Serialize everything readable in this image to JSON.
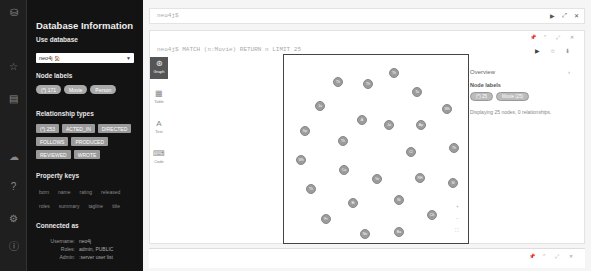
{
  "rail": {
    "icons": [
      {
        "name": "database-icon",
        "glyph": "⛁",
        "top": 6
      },
      {
        "name": "favorites-icon",
        "glyph": "☆",
        "top": 60
      },
      {
        "name": "documents-icon",
        "glyph": "▤",
        "top": 92
      },
      {
        "name": "cloud-icon",
        "glyph": "☁",
        "top": 150
      },
      {
        "name": "help-icon",
        "glyph": "?",
        "top": 180
      },
      {
        "name": "settings-icon",
        "glyph": "⚙",
        "top": 212
      },
      {
        "name": "about-icon",
        "glyph": "ⓘ",
        "top": 240
      }
    ]
  },
  "drawer": {
    "title": "Database Information",
    "use_database": {
      "label": "Use database",
      "value": "neo4j",
      "value_icon": "🏠"
    },
    "node_labels": {
      "label": "Node labels",
      "items": [
        "(*) 171",
        "Movie",
        "Person"
      ]
    },
    "relationship_types": {
      "label": "Relationship types",
      "items": [
        "(*) 253",
        "ACTED_IN",
        "DIRECTED",
        "FOLLOWS",
        "PRODUCED",
        "REVIEWED",
        "WROTE"
      ]
    },
    "property_keys": {
      "label": "Property keys",
      "items": [
        "born",
        "name",
        "rating",
        "released",
        "roles",
        "summary",
        "tagline",
        "title"
      ]
    },
    "connected_as": {
      "label": "Connected as",
      "rows": [
        {
          "key": "Username:",
          "value": "neo4j"
        },
        {
          "key": "Roles:",
          "value": "admin, PUBLIC"
        },
        {
          "key": "Admin:",
          "value": ":server user list"
        }
      ]
    }
  },
  "topbar": {
    "prompt": "neo4j$",
    "controls": [
      "▶",
      "⤢",
      "✕"
    ]
  },
  "frame": {
    "editor_query": "neo4j$ MATCH (n:Movie) RETURN n LIMIT 25",
    "frame_controls": [
      "📌",
      "⌃",
      "⤢",
      "✕"
    ],
    "editor_controls": [
      "▶",
      "☆",
      "⬇"
    ],
    "view_tabs": [
      {
        "name": "graph",
        "glyph": "⊛",
        "label": "Graph",
        "active": true
      },
      {
        "name": "table",
        "glyph": "▦",
        "label": "Table",
        "active": false
      },
      {
        "name": "text",
        "glyph": "A",
        "label": "Text",
        "active": false
      },
      {
        "name": "code",
        "glyph": "⌨",
        "label": "Code",
        "active": false
      }
    ],
    "graph": {
      "node_count": 25,
      "nodes": [
        {
          "x": 393,
          "y": 72,
          "label": "Th"
        },
        {
          "x": 337,
          "y": 81,
          "label": "Th"
        },
        {
          "x": 367,
          "y": 83,
          "label": "Th"
        },
        {
          "x": 416,
          "y": 91,
          "label": "To"
        },
        {
          "x": 319,
          "y": 105,
          "label": "Ju"
        },
        {
          "x": 446,
          "y": 108,
          "label": "Wh"
        },
        {
          "x": 361,
          "y": 119,
          "label": "A"
        },
        {
          "x": 388,
          "y": 124,
          "label": "Jo"
        },
        {
          "x": 420,
          "y": 124,
          "label": "Ap"
        },
        {
          "x": 304,
          "y": 130,
          "label": "Sp"
        },
        {
          "x": 342,
          "y": 140,
          "label": "Th"
        },
        {
          "x": 410,
          "y": 151,
          "label": "Cl"
        },
        {
          "x": 453,
          "y": 147,
          "label": "Th"
        },
        {
          "x": 300,
          "y": 159,
          "label": "Wh"
        },
        {
          "x": 343,
          "y": 169,
          "label": "Ca"
        },
        {
          "x": 376,
          "y": 178,
          "label": "Yo"
        },
        {
          "x": 419,
          "y": 177,
          "label": "RH"
        },
        {
          "x": 452,
          "y": 182,
          "label": "Sl"
        },
        {
          "x": 310,
          "y": 188,
          "label": "Th"
        },
        {
          "x": 352,
          "y": 202,
          "label": "Bi"
        },
        {
          "x": 398,
          "y": 199,
          "label": "Ni"
        },
        {
          "x": 431,
          "y": 214,
          "label": "Ch"
        },
        {
          "x": 325,
          "y": 218,
          "label": "Fr"
        },
        {
          "x": 364,
          "y": 233,
          "label": "Ne"
        },
        {
          "x": 398,
          "y": 231,
          "label": "Ba"
        }
      ],
      "zoom_controls": [
        "+",
        "−",
        "⛶"
      ]
    },
    "overview": {
      "title": "Overview",
      "toggle": "›",
      "node_labels_title": "Node labels",
      "node_labels": [
        "(*) 25",
        "Movie (25)"
      ],
      "description": "Displaying 25 nodes, 0 relationships."
    }
  },
  "bottombar": {
    "controls": [
      "📌",
      "⌃",
      "⤢",
      "✕"
    ]
  }
}
